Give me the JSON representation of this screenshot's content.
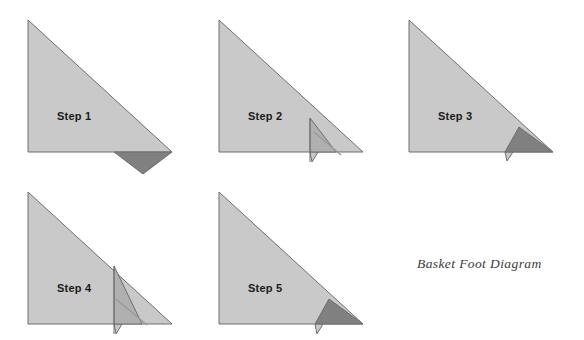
{
  "diagram": {
    "caption": "Basket Foot Diagram",
    "caption_position": {
      "x": 417,
      "y": 256
    },
    "background_color": "#ffffff",
    "colors": {
      "paper_light": "#c9c9c9",
      "paper_mid": "#b0b0b0",
      "paper_dark": "#808080",
      "outline": "#6e6e6e",
      "fold_line": "#8f8f8f",
      "label_text": "#1a1a1a",
      "caption_text": "#3b3b3b"
    },
    "steps": [
      {
        "id": "step-1",
        "label": "Step 1",
        "label_position": {
          "x": 57,
          "y": 110
        },
        "origin": {
          "x": 28,
          "y": 20
        },
        "base_triangle": "28,20 28,152 172,152",
        "flap": {
          "name": "folded-down-flap",
          "points": "114,152 172,152 143,174",
          "fill": "paper_dark"
        },
        "fold_lines": []
      },
      {
        "id": "step-2",
        "label": "Step 2",
        "label_position": {
          "x": 248,
          "y": 110
        },
        "origin": {
          "x": 219,
          "y": 20
        },
        "base_triangle": "219,20 219,152 363,152",
        "flap": {
          "name": "folded-up-flap",
          "points": "310,118 310,152 336,152",
          "fill": "paper_mid"
        },
        "tab": {
          "name": "small-tab",
          "points": "310,152 318,152 312,162",
          "fill": "paper_light"
        },
        "fold_lines": [
          {
            "name": "vertical-fold",
            "x1": 310,
            "y1": 118,
            "x2": 310,
            "y2": 162
          },
          {
            "name": "diagonal-crease",
            "x1": 314,
            "y1": 133,
            "x2": 340,
            "y2": 155
          }
        ]
      },
      {
        "id": "step-3",
        "label": "Step 3",
        "label_position": {
          "x": 438,
          "y": 110
        },
        "origin": {
          "x": 409,
          "y": 20
        },
        "base_triangle": "409,20 409,152 553,152",
        "flap": {
          "name": "inner-dark-flap",
          "points": "505,152 553,152 519,127",
          "fill": "paper_dark"
        },
        "tab": {
          "name": "small-tab",
          "points": "505,152 513,152 507,161",
          "fill": "paper_light"
        },
        "fold_lines": []
      },
      {
        "id": "step-4",
        "label": "Step 4",
        "label_position": {
          "x": 57,
          "y": 282
        },
        "origin": {
          "x": 28,
          "y": 192
        },
        "base_triangle": "28,192 28,324 172,324",
        "flap": {
          "name": "folded-up-flap",
          "points": "114,266 114,324 142,324",
          "fill": "paper_mid"
        },
        "tab": {
          "name": "small-tab",
          "points": "114,324 122,324 116,334",
          "fill": "paper_light"
        },
        "fold_lines": [
          {
            "name": "vertical-fold",
            "x1": 114,
            "y1": 266,
            "x2": 114,
            "y2": 334
          },
          {
            "name": "diagonal-crease",
            "x1": 116,
            "y1": 300,
            "x2": 146,
            "y2": 324
          }
        ]
      },
      {
        "id": "step-5",
        "label": "Step 5",
        "label_position": {
          "x": 248,
          "y": 282
        },
        "origin": {
          "x": 219,
          "y": 192
        },
        "base_triangle": "219,192 219,324 363,324",
        "flap": {
          "name": "inner-dark-flap",
          "points": "315,324 363,324 329,299",
          "fill": "paper_dark"
        },
        "tab": {
          "name": "small-tab",
          "points": "315,324 323,324 317,334",
          "fill": "paper_light"
        },
        "fold_lines": []
      }
    ]
  }
}
